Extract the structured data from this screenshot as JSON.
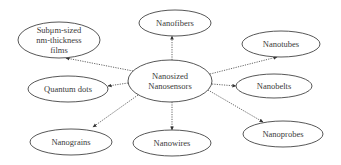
{
  "diagram": {
    "type": "mind-map",
    "center": {
      "id": "center",
      "lines": [
        "Nanosized",
        "Nanosensors"
      ],
      "cx": 170,
      "cy": 81,
      "rx": 42,
      "ry": 21
    },
    "nodes": [
      {
        "id": "nanofibers",
        "lines": [
          "Nanofibers"
        ],
        "cx": 175,
        "cy": 23,
        "rx": 36,
        "ry": 13,
        "arrow": [
          172,
          36
        ]
      },
      {
        "id": "nanotubes",
        "lines": [
          "Nanotubes"
        ],
        "cx": 281,
        "cy": 44,
        "rx": 39,
        "ry": 13,
        "arrow": [
          277,
          57
        ]
      },
      {
        "id": "nanobelts",
        "lines": [
          "Nanobelts"
        ],
        "cx": 274,
        "cy": 86,
        "rx": 38,
        "ry": 12,
        "arrow": [
          236,
          86
        ]
      },
      {
        "id": "nanoprobes",
        "lines": [
          "Nanoprobes"
        ],
        "cx": 283,
        "cy": 134,
        "rx": 40,
        "ry": 13,
        "arrow": [
          263,
          122
        ]
      },
      {
        "id": "nanowires",
        "lines": [
          "Nanowires"
        ],
        "cx": 172,
        "cy": 143,
        "rx": 39,
        "ry": 13,
        "arrow": [
          172,
          130
        ]
      },
      {
        "id": "nanograins",
        "lines": [
          "Nanograins"
        ],
        "cx": 71,
        "cy": 142,
        "rx": 41,
        "ry": 13,
        "arrow": [
          93,
          127
        ]
      },
      {
        "id": "quantum-dots",
        "lines": [
          "Quantum dots"
        ],
        "cx": 68,
        "cy": 89,
        "rx": 40,
        "ry": 13,
        "arrow": [
          108,
          86
        ]
      },
      {
        "id": "subum-films",
        "lines": [
          "Subμm-sized",
          "nm-thickness",
          "films"
        ],
        "cx": 59,
        "cy": 40,
        "rx": 41,
        "ry": 18,
        "arrow": [
          66,
          58
        ]
      }
    ],
    "edges": [
      {
        "from": "center",
        "to": "nanofibers",
        "start": [
          172,
          60
        ]
      },
      {
        "from": "center",
        "to": "nanotubes",
        "start": [
          210,
          74
        ]
      },
      {
        "from": "center",
        "to": "nanobelts",
        "start": [
          212,
          84
        ]
      },
      {
        "from": "center",
        "to": "nanoprobes",
        "start": [
          208,
          90
        ]
      },
      {
        "from": "center",
        "to": "nanowires",
        "start": [
          172,
          102
        ]
      },
      {
        "from": "center",
        "to": "nanograins",
        "start": [
          138,
          95
        ]
      },
      {
        "from": "center",
        "to": "quantum-dots",
        "start": [
          128,
          83
        ]
      },
      {
        "from": "center",
        "to": "subum-films",
        "start": [
          133,
          71
        ]
      }
    ]
  }
}
